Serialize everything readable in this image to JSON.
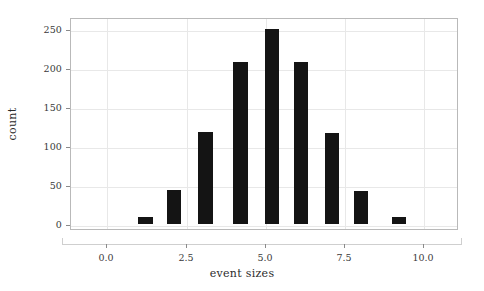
{
  "chart_data": {
    "type": "bar",
    "title": "",
    "subtitle": "",
    "xlabel": "event sizes",
    "ylabel": "count",
    "xlim": [
      -1.15,
      11.1
    ],
    "ylim": [
      -6,
      266
    ],
    "grid": true,
    "legend": null,
    "legend_position": "none",
    "bar_color": "#141414",
    "bar_width": 0.45,
    "x": [
      1.2,
      2.1,
      3.1,
      4.2,
      5.2,
      6.1,
      7.1,
      8.0,
      9.2
    ],
    "values": [
      9,
      44,
      118,
      208,
      250,
      208,
      117,
      43,
      9
    ],
    "categories": [
      "1.2",
      "2.1",
      "3.1",
      "4.2",
      "5.2",
      "6.1",
      "7.1",
      "8.0",
      "9.2"
    ],
    "xticks": [
      0.0,
      2.5,
      5.0,
      7.5,
      10.0
    ],
    "xtick_labels": [
      "0.0",
      "2.5",
      "5.0",
      "7.5",
      "10.0"
    ],
    "yticks": [
      0,
      50,
      100,
      150,
      200,
      250
    ],
    "ytick_labels": [
      "0",
      "50",
      "100",
      "150",
      "200",
      "250"
    ],
    "annotations": []
  },
  "axes": {
    "frame_color": "#b9b9b9",
    "grid_color": "#e8e8e8",
    "tick_color": "#8a8a8a",
    "text_color": "#3a3a3a"
  }
}
